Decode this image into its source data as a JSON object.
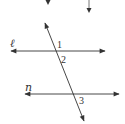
{
  "diagram": {
    "type": "parallel-lines-transversal",
    "lines": [
      {
        "id": "l",
        "label": "ℓ"
      },
      {
        "id": "n",
        "label": "n"
      }
    ],
    "angles": [
      {
        "id": "angle-1",
        "label": "1"
      },
      {
        "id": "angle-2",
        "label": "2"
      },
      {
        "id": "angle-3",
        "label": "3"
      }
    ],
    "stroke_color": "#333333",
    "background": "#ffffff"
  }
}
